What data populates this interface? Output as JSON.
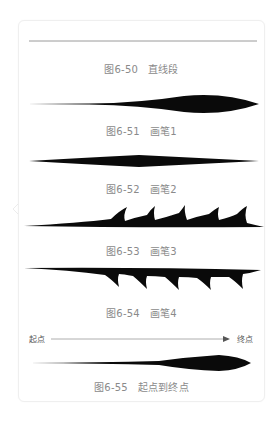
{
  "figures": [
    {
      "number": "图6-50",
      "title": "直线段"
    },
    {
      "number": "图6-51",
      "title": "画笔1"
    },
    {
      "number": "图6-52",
      "title": "画笔2"
    },
    {
      "number": "图6-53",
      "title": "画笔3"
    },
    {
      "number": "图6-54",
      "title": "画笔4"
    },
    {
      "number": "图6-55",
      "title": "起点到终点"
    }
  ],
  "direction": {
    "start_label": "起点",
    "end_label": "终点"
  },
  "colors": {
    "stroke": "#0a0a0a",
    "caption": "#8a8a8a",
    "line": "#999999",
    "card_border": "#efefef"
  }
}
